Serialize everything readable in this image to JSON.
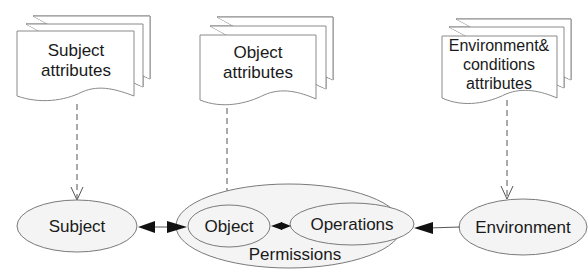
{
  "diagram": {
    "documents": [
      {
        "id": "subject-attributes",
        "lines": [
          "Subject",
          "attributes"
        ]
      },
      {
        "id": "object-attributes",
        "lines": [
          "Object",
          "attributes"
        ]
      },
      {
        "id": "environment-attributes",
        "lines": [
          "Environment&",
          "conditions",
          "attributes"
        ]
      }
    ],
    "nodes": {
      "subject": "Subject",
      "permissions": "Permissions",
      "object": "Object",
      "operations": "Operations",
      "environment": "Environment"
    },
    "edges": [
      {
        "from": "Subject attributes",
        "to": "Subject",
        "style": "dashed",
        "head": "open"
      },
      {
        "from": "Object attributes",
        "to": "Object",
        "style": "dashed",
        "head": "open"
      },
      {
        "from": "Environment& conditions attributes",
        "to": "Environment",
        "style": "dashed",
        "head": "open"
      },
      {
        "from": "Subject",
        "to": "Object",
        "style": "solid",
        "head": "filled",
        "bidirectional": true
      },
      {
        "from": "Object",
        "to": "Operations",
        "style": "solid",
        "head": "filled",
        "bidirectional": true
      },
      {
        "from": "Environment",
        "to": "Permissions",
        "style": "solid",
        "head": "filled",
        "bidirectional": false
      }
    ]
  }
}
